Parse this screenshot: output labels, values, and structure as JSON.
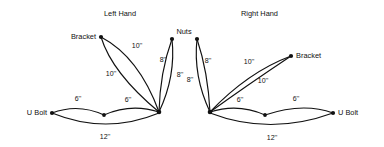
{
  "diagram": {
    "title_left": "Left Hand",
    "title_right": "Right Hand",
    "stroke_color": "#111111",
    "background_color": "#ffffff",
    "node_labels": {
      "bracket_left": "Bracket",
      "bracket_right": "Bracket",
      "nuts": "Nuts",
      "ubolt_left": "U Bolt",
      "ubolt_right": "U Bolt"
    },
    "measurements": {
      "bracket_left_outer": "10''",
      "bracket_left_inner": "10''",
      "bracket_right_outer": "10''",
      "bracket_right_inner": "10''",
      "nuts_left_outer": "8''",
      "nuts_left_inner": "8''",
      "nuts_right_inner": "8''",
      "nuts_right_outer": "8''",
      "ubolt_left_far": "6''",
      "ubolt_left_near": "6''",
      "ubolt_left_span": "12''",
      "ubolt_right_near": "6''",
      "ubolt_right_far": "6''",
      "ubolt_right_span": "12''"
    }
  }
}
